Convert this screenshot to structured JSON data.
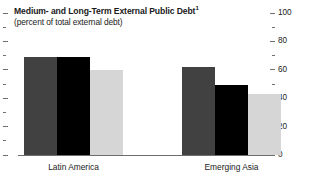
{
  "chart_data": {
    "type": "bar",
    "title": "Medium- and Long-Term External Public Debt",
    "title_footnote_marker": "1",
    "subtitle": "(percent of total external debt)",
    "xlabel": "",
    "ylabel": "",
    "ylim": [
      0,
      100
    ],
    "y_major_ticks": [
      0,
      20,
      40,
      60,
      80,
      100
    ],
    "y_minor_ticks": [
      10,
      30,
      50,
      70,
      90
    ],
    "y_tick_labels": [
      "0",
      "20",
      "40",
      "60",
      "80",
      "100"
    ],
    "y_axis_position": "right",
    "grid": false,
    "legend": "none",
    "categories": [
      "Latin America",
      "Emerging Asia"
    ],
    "series": [
      {
        "name": "series-1",
        "color": "#414141",
        "values": [
          69,
          62
        ]
      },
      {
        "name": "series-2",
        "color": "#000000",
        "values": [
          69,
          49
        ]
      },
      {
        "name": "series-3",
        "color": "#d6d6d6",
        "values": [
          60,
          43
        ]
      }
    ]
  },
  "colors": {
    "background": "#ffffff",
    "axis": "#6e6e6e",
    "text": "#1a1a1a",
    "bar_dark": "#414141",
    "bar_black": "#000000",
    "bar_light": "#d6d6d6"
  }
}
